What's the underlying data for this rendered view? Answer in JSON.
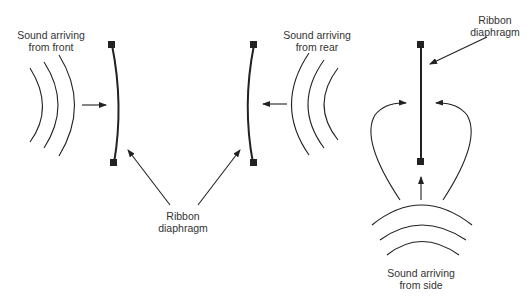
{
  "diagram": {
    "panels": [
      {
        "id": "front",
        "label_line1": "Sound arriving",
        "label_line2": "from front"
      },
      {
        "id": "rear",
        "label_line1": "Sound arriving",
        "label_line2": "from rear"
      },
      {
        "id": "side",
        "label_line1": "Sound arriving",
        "label_line2": "from side"
      }
    ],
    "shared_label": {
      "line1": "Ribbon",
      "line2": "diaphragm"
    },
    "side_label": {
      "line1": "Ribbon",
      "line2": "diaphragm"
    },
    "colors": {
      "stroke": "#222222",
      "text": "#333333",
      "background": "#ffffff"
    }
  }
}
